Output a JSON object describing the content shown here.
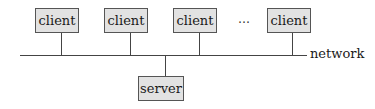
{
  "diagram": {
    "type": "client-server network topology",
    "clients": [
      {
        "label": "client"
      },
      {
        "label": "client"
      },
      {
        "label": "client"
      },
      {
        "label": "client"
      }
    ],
    "ellipsis": "…",
    "network_label": "network",
    "server": {
      "label": "server"
    },
    "colors": {
      "box_fill": "#e2e2e2",
      "box_border": "#555555",
      "line": "#444444"
    }
  }
}
